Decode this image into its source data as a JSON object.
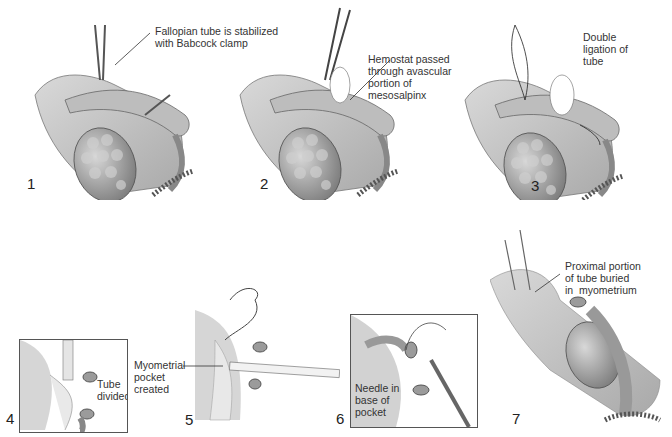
{
  "figure": {
    "panels": [
      {
        "number": "1",
        "label": "Fallopian tube is stabilized\nwith Babcock clamp"
      },
      {
        "number": "2",
        "label": "Hemostat passed\nthrough avascular\nportion of\nmesosalpinx"
      },
      {
        "number": "3",
        "label": "Double\nligation of\ntube"
      },
      {
        "number": "4",
        "label": "Tube\ndivided"
      },
      {
        "number": "5",
        "label": "Myometrial\npocket\ncreated"
      },
      {
        "number": "6",
        "label": "Needle in\nbase of\npocket"
      },
      {
        "number": "7",
        "label": "Proximal portion\nof tube buried\nin  myometrium"
      }
    ]
  },
  "colors": {
    "tissue": "#c9c9c9",
    "tissue_dark": "#8c8c8c",
    "ovary": "#9a9a9a",
    "line": "#444444"
  }
}
